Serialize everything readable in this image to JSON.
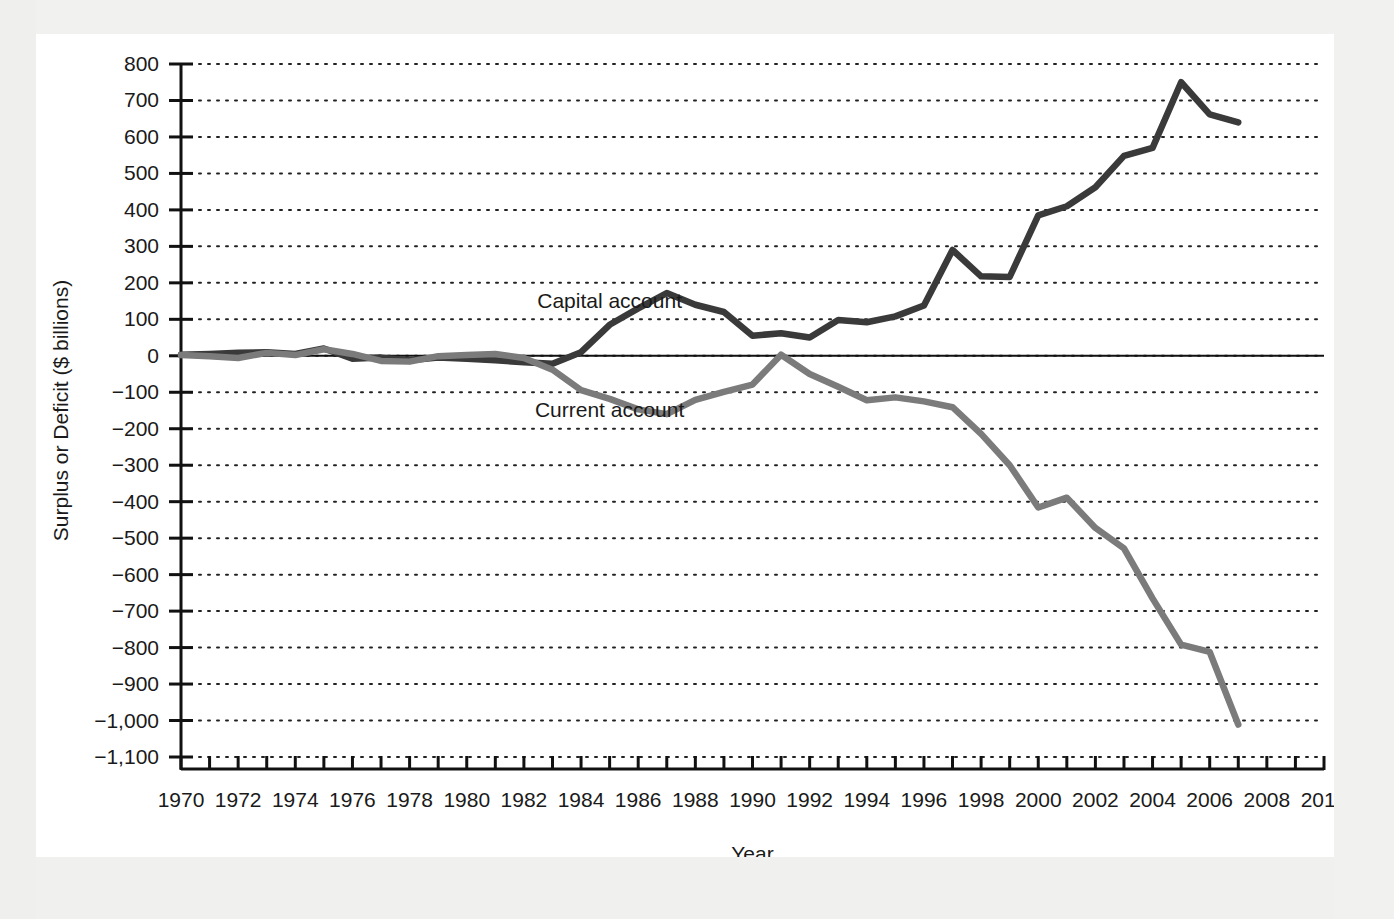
{
  "chart_data": {
    "type": "line",
    "title": "",
    "xlabel": "Year",
    "ylabel": "Surplus or Deficit ($ billions)",
    "xlim": [
      1970,
      2010
    ],
    "ylim": [
      -1100,
      800
    ],
    "grid": "horizontal-dotted",
    "legend": "inline-annotations",
    "y_ticks": [
      800,
      700,
      600,
      500,
      400,
      300,
      200,
      100,
      0,
      -100,
      -200,
      -300,
      -400,
      -500,
      -600,
      -700,
      -800,
      -900,
      -1000,
      -1100
    ],
    "y_tick_labels": [
      "800",
      "700",
      "600",
      "500",
      "400",
      "300",
      "200",
      "100",
      "0",
      "−100",
      "−200",
      "−300",
      "−400",
      "−500",
      "−600",
      "−700",
      "−800",
      "−900",
      "−1,000",
      "−1,100"
    ],
    "x_ticks": [
      1970,
      1971,
      1972,
      1973,
      1974,
      1975,
      1976,
      1977,
      1978,
      1979,
      1980,
      1981,
      1982,
      1983,
      1984,
      1985,
      1986,
      1987,
      1988,
      1989,
      1990,
      1991,
      1992,
      1993,
      1994,
      1995,
      1996,
      1997,
      1998,
      1999,
      2000,
      2001,
      2002,
      2003,
      2004,
      2005,
      2006,
      2007,
      2008,
      2009,
      2010
    ],
    "x_tick_labels_shown": [
      "1970",
      "1972",
      "1974",
      "1976",
      "1978",
      "1980",
      "1982",
      "1984",
      "1986",
      "1988",
      "1990",
      "1992",
      "1994",
      "1996",
      "1998",
      "2000",
      "2002",
      "2004",
      "2006",
      "2008",
      "2010"
    ],
    "x": [
      1970,
      1971,
      1972,
      1973,
      1974,
      1975,
      1976,
      1977,
      1978,
      1979,
      1980,
      1981,
      1982,
      1983,
      1984,
      1985,
      1986,
      1987,
      1988,
      1989,
      1990,
      1991,
      1992,
      1993,
      1994,
      1995,
      1996,
      1997,
      1998,
      1999,
      2000,
      2001,
      2002,
      2003,
      2004,
      2005,
      2006,
      2007
    ],
    "series": [
      {
        "name": "Capital account",
        "color": "#3a3a3a",
        "label_x": 1985,
        "label_y": 150,
        "values": [
          3,
          5,
          8,
          10,
          5,
          20,
          -8,
          -5,
          -12,
          -5,
          -8,
          -12,
          -18,
          -22,
          10,
          85,
          130,
          172,
          140,
          120,
          55,
          62,
          50,
          98,
          92,
          108,
          138,
          290,
          218,
          216,
          385,
          410,
          462,
          548,
          570,
          750,
          662,
          640
        ]
      },
      {
        "name": "Current account",
        "color": "#7b7b7b",
        "label_x": 1985,
        "label_y": -148,
        "values": [
          2,
          -1,
          -6,
          8,
          2,
          18,
          5,
          -14,
          -16,
          -1,
          2,
          5,
          -6,
          -38,
          -94,
          -118,
          -147,
          -160,
          -121,
          -99,
          -79,
          3,
          -50,
          -85,
          -122,
          -114,
          -125,
          -141,
          -214,
          -300,
          -416,
          -389,
          -472,
          -528,
          -665,
          -792,
          -812,
          -1011
        ]
      }
    ]
  },
  "annotations": {
    "capital_label": "Capital account",
    "current_label": "Current account"
  }
}
